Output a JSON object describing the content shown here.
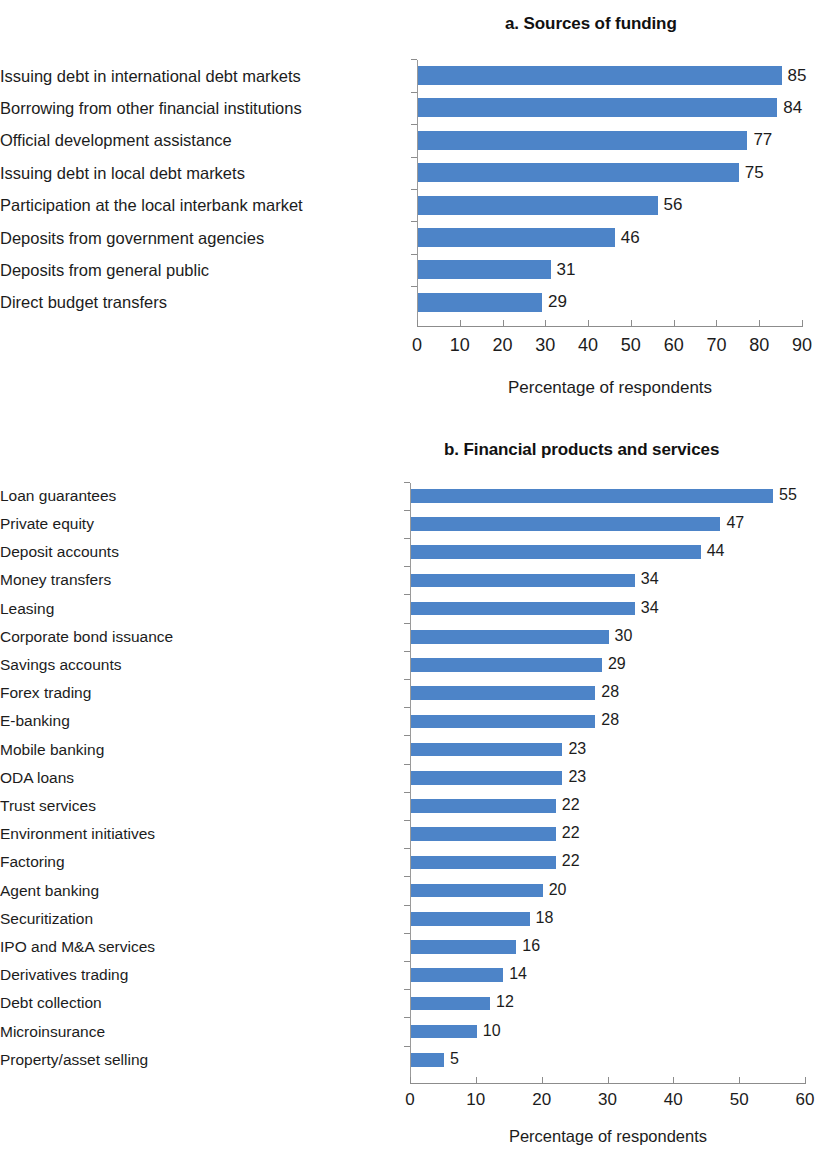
{
  "chart_data": [
    {
      "type": "bar",
      "orientation": "horizontal",
      "title": "a. Sources of funding",
      "xlabel": "Percentage of respondents",
      "ylabel": "",
      "xlim": [
        0,
        90
      ],
      "xticks": [
        0,
        10,
        20,
        30,
        40,
        50,
        60,
        70,
        80,
        90
      ],
      "grid": false,
      "legend": null,
      "bar_color": "#4d84c8",
      "categories": [
        "Issuing debt in international debt markets",
        "Borrowing from other financial institutions",
        "Official development assistance",
        "Issuing debt in local debt markets",
        "Participation at the local interbank market",
        "Deposits from government agencies",
        "Deposits from general public",
        "Direct budget transfers"
      ],
      "values": [
        85,
        84,
        77,
        75,
        56,
        46,
        31,
        29
      ]
    },
    {
      "type": "bar",
      "orientation": "horizontal",
      "title": "b. Financial products and services",
      "xlabel": "Percentage of respondents",
      "ylabel": "",
      "xlim": [
        0,
        60
      ],
      "xticks": [
        0,
        10,
        20,
        30,
        40,
        50,
        60
      ],
      "grid": false,
      "legend": null,
      "bar_color": "#4d84c8",
      "categories": [
        "Loan guarantees",
        "Private equity",
        "Deposit accounts",
        "Money transfers",
        "Leasing",
        "Corporate bond issuance",
        "Savings accounts",
        "Forex trading",
        "E-banking",
        "Mobile banking",
        "ODA loans",
        "Trust services",
        "Environment initiatives",
        "Factoring",
        "Agent banking",
        "Securitization",
        "IPO and M&A services",
        "Derivatives trading",
        "Debt collection",
        "Microinsurance",
        "Property/asset selling"
      ],
      "values": [
        55,
        47,
        44,
        34,
        34,
        30,
        29,
        28,
        28,
        23,
        23,
        22,
        22,
        22,
        20,
        18,
        16,
        14,
        12,
        10,
        5
      ]
    }
  ]
}
